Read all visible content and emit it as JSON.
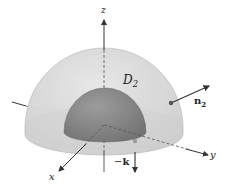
{
  "figure": {
    "colors": {
      "background": "#ffffff",
      "outer_hemisphere_fill": "#d9d9d9",
      "outer_hemisphere_edge": "#b5b5b5",
      "inner_hemisphere_fill": "#8f8f8f",
      "inner_hemisphere_shade": "#6e6e6e",
      "axis": "#333333",
      "arrow": "#333333",
      "point": "#555555"
    },
    "axes": {
      "x_label": "x",
      "y_label": "y",
      "z_label": "z"
    },
    "surface_label": {
      "main": "D",
      "sub": "2"
    },
    "vectors": {
      "normal": {
        "main": "n",
        "sub": "2"
      },
      "down": {
        "prefix": "−",
        "main": "k"
      }
    }
  }
}
